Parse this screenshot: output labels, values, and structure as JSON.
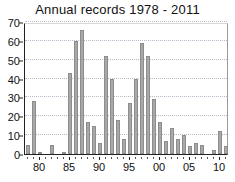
{
  "chart_data": {
    "type": "bar",
    "title": "Annual records 1978 - 2011",
    "xlabel": "",
    "ylabel": "",
    "ylim": [
      0,
      70
    ],
    "ytick_values": [
      0,
      10,
      20,
      30,
      40,
      50,
      60,
      70
    ],
    "ytick_labels": [
      "0",
      "10",
      "20",
      "30",
      "40",
      "50",
      "60",
      "70"
    ],
    "xtick_labels": [
      "80",
      "85",
      "90",
      "95",
      "00",
      "05",
      "10"
    ],
    "xtick_years": [
      1980,
      1985,
      1990,
      1995,
      2000,
      2005,
      2010
    ],
    "grid": true,
    "legend": false,
    "bar_color": "#a8a8a8",
    "bar_edge_color": "#8d8d8d",
    "axis_color": "#222222",
    "gridline_color": "#b9b9c9",
    "categories": [
      "1978",
      "1979",
      "1980",
      "1981",
      "1982",
      "1983",
      "1984",
      "1985",
      "1986",
      "1987",
      "1988",
      "1989",
      "1990",
      "1991",
      "1992",
      "1993",
      "1994",
      "1995",
      "1996",
      "1997",
      "1998",
      "1999",
      "2000",
      "2001",
      "2002",
      "2003",
      "2004",
      "2005",
      "2006",
      "2007",
      "2008",
      "2009",
      "2010",
      "2011"
    ],
    "values": [
      5,
      28,
      1,
      0,
      5,
      0,
      1,
      43,
      60,
      66,
      17,
      15,
      6,
      52,
      40,
      18,
      8,
      27,
      40,
      59,
      52,
      29,
      17,
      7,
      14,
      8,
      10,
      4,
      6,
      5,
      0,
      2,
      12,
      4
    ]
  }
}
